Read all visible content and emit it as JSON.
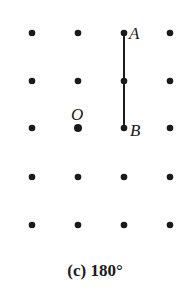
{
  "diagram": {
    "grid": {
      "columns": 4,
      "rows": 5
    },
    "segment": {
      "from": "A",
      "to": "B"
    },
    "points": [
      {
        "name": "A",
        "col": 2,
        "row": 0
      },
      {
        "name": "B",
        "col": 2,
        "row": 2
      },
      {
        "name": "O",
        "col": 1,
        "row": 2
      }
    ],
    "labels": {
      "A": "A",
      "B": "B",
      "O": "O"
    },
    "caption": "(c) 180°",
    "colors": {
      "ink": "#1a1a1a"
    }
  }
}
